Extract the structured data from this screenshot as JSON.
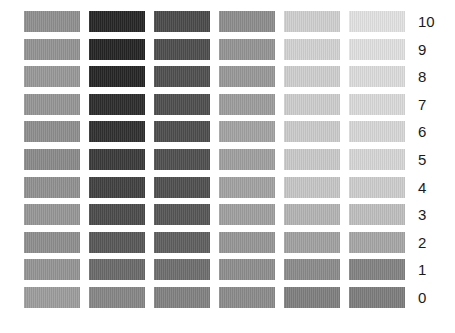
{
  "chart_data": {
    "type": "heatmap",
    "title": "",
    "subtitle": "",
    "xlabel": "",
    "ylabel": "",
    "grid": false,
    "legend_position": "none",
    "row_labels": [
      "10",
      "9",
      "8",
      "7",
      "6",
      "5",
      "4",
      "3",
      "2",
      "1",
      "0"
    ],
    "column_labels": [
      "1",
      "2",
      "3",
      "4",
      "5",
      "6"
    ],
    "value_type": "gray_level_hex",
    "rows": [
      {
        "label": "10",
        "colors": [
          "#8f8f8f",
          "#262626",
          "#4a4a4a",
          "#8d8d8d",
          "#cfcfcf",
          "#e2e2e2"
        ]
      },
      {
        "label": "9",
        "colors": [
          "#939393",
          "#242424",
          "#4d4d4d",
          "#949494",
          "#d2d2d2",
          "#e0e0e0"
        ]
      },
      {
        "label": "8",
        "colors": [
          "#989898",
          "#252525",
          "#4f4f4f",
          "#989898",
          "#cecece",
          "#dcdcdc"
        ]
      },
      {
        "label": "7",
        "colors": [
          "#959595",
          "#2c2c2c",
          "#4e4e4e",
          "#9d9d9d",
          "#cdcdcd",
          "#dadada"
        ]
      },
      {
        "label": "6",
        "colors": [
          "#8e8e8e",
          "#303030",
          "#4d4d4d",
          "#a3a3a3",
          "#cbcbcb",
          "#d7d7d7"
        ]
      },
      {
        "label": "5",
        "colors": [
          "#8a8a8a",
          "#3a3a3a",
          "#4f4f4f",
          "#a0a0a0",
          "#c9c9c9",
          "#d6d6d6"
        ]
      },
      {
        "label": "4",
        "colors": [
          "#909090",
          "#414141",
          "#4f4f4f",
          "#a2a2a2",
          "#c6c6c6",
          "#cdcdcd"
        ]
      },
      {
        "label": "3",
        "colors": [
          "#969696",
          "#4b4b4b",
          "#565656",
          "#a0a0a0",
          "#b4b4b4",
          "#bebebe"
        ]
      },
      {
        "label": "2",
        "colors": [
          "#8e8e8e",
          "#585858",
          "#5f5f5f",
          "#969696",
          "#a1a1a1",
          "#a6a6a6"
        ]
      },
      {
        "label": "1",
        "colors": [
          "#949494",
          "#6a6a6a",
          "#6e6e6e",
          "#8e8e8e",
          "#8b8b8b",
          "#828282"
        ]
      },
      {
        "label": "0",
        "colors": [
          "#9d9d9d",
          "#868686",
          "#818181",
          "#8b8b8b",
          "#7f7f7f",
          "#7d7d7d"
        ]
      }
    ],
    "layout": {
      "background": "#ffffff",
      "patch_width": 56,
      "patch_height": 21,
      "column_pitch": 65,
      "row_pitch": 27.6,
      "first_column_x": 24,
      "first_row_y": 11,
      "label_x": 418
    }
  }
}
